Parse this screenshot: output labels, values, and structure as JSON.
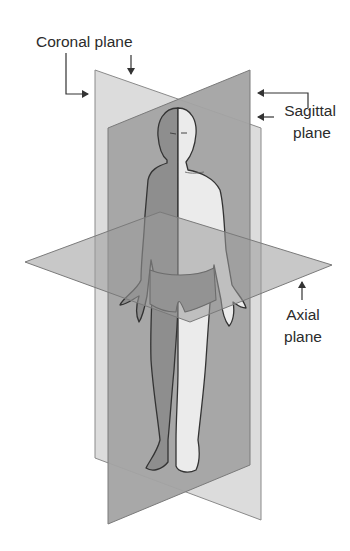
{
  "labels": {
    "coronal": "Coronal plane",
    "sagittal_line1": "Sagittal",
    "sagittal_line2": "plane",
    "axial_line1": "Axial",
    "axial_line2": "plane"
  },
  "colors": {
    "background": "#ffffff",
    "coronal_plane": "#dcdcdc",
    "sagittal_plane": "#9e9e9e",
    "axial_plane": "#a8a8a8",
    "plane_edge": "#7a7a7a",
    "body_light": "#ebebeb",
    "body_shadow": "#8f8f8f",
    "outline": "#333333",
    "text": "#2b2b2b"
  }
}
